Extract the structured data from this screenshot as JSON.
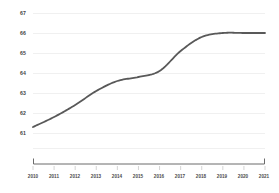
{
  "chart_data": {
    "type": "line",
    "title": "",
    "subtitle": "",
    "xlabel": "",
    "ylabel": "",
    "categories": [
      "2010",
      "2011",
      "2012",
      "2013",
      "2014",
      "2015",
      "2016",
      "2017",
      "2018",
      "2019",
      "2020",
      "2021"
    ],
    "x": [
      2010,
      2011,
      2012,
      2013,
      2014,
      2015,
      2016,
      2017,
      2018,
      2019,
      2020,
      2021
    ],
    "values": [
      61.3,
      61.8,
      62.4,
      63.1,
      63.6,
      63.8,
      64.1,
      65.1,
      65.8,
      66.0,
      66.0,
      66.0
    ],
    "series": [
      {
        "name": "",
        "values": [
          61.3,
          61.8,
          62.4,
          63.1,
          63.6,
          63.8,
          64.1,
          65.1,
          65.8,
          66.0,
          66.0,
          66.0
        ]
      }
    ],
    "ylim": [
      60.5,
      67.4
    ],
    "xlim": [
      2010,
      2021
    ],
    "yticks": [
      67,
      66,
      65,
      64,
      63,
      62,
      61
    ],
    "ytick_labels": [
      "67",
      "66",
      "65",
      "64",
      "63",
      "62",
      "61"
    ],
    "xtick_labels": [
      "2010",
      "2011",
      "2012",
      "2013",
      "2014",
      "2015",
      "2016",
      "2017",
      "2018",
      "2019",
      "2020",
      "2021"
    ],
    "grid": true,
    "grid_axis": "y",
    "legend": false,
    "legend_position": "none",
    "annotations": [],
    "line_color": "#595959",
    "grid_color": "#f0f0f0",
    "axis_color": "#6b6b6b",
    "label_color": "#3f3f3f",
    "background_color": "#ffffff"
  }
}
